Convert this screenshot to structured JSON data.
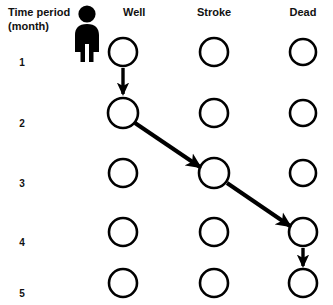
{
  "figure": {
    "title_line1": "Time period",
    "title_line2": "(month)",
    "person_icon": "person-pictogram"
  },
  "columns": [
    {
      "id": "well",
      "label": "Well",
      "x": 123
    },
    {
      "id": "stroke",
      "label": "Stroke",
      "x": 214
    },
    {
      "id": "dead",
      "label": "Dead",
      "x": 303
    }
  ],
  "rows": [
    {
      "label": "1",
      "y": 52,
      "label_y": 66
    },
    {
      "label": "2",
      "y": 113,
      "label_y": 127
    },
    {
      "label": "3",
      "y": 173,
      "label_y": 187
    },
    {
      "label": "4",
      "y": 232,
      "label_y": 246
    },
    {
      "label": "5",
      "y": 283,
      "label_y": 297
    }
  ],
  "nodes": [
    {
      "row": 1,
      "column": "well",
      "state": "Well",
      "cx": 123,
      "cy": 52,
      "r": 14
    },
    {
      "row": 1,
      "column": "stroke",
      "state": "Stroke",
      "cx": 214,
      "cy": 52,
      "r": 14
    },
    {
      "row": 1,
      "column": "dead",
      "state": "Dead",
      "cx": 303,
      "cy": 52,
      "r": 13
    },
    {
      "row": 2,
      "column": "well",
      "state": "Well",
      "cx": 123,
      "cy": 113,
      "r": 15
    },
    {
      "row": 2,
      "column": "stroke",
      "state": "Stroke",
      "cx": 214,
      "cy": 113,
      "r": 14
    },
    {
      "row": 2,
      "column": "dead",
      "state": "Dead",
      "cx": 303,
      "cy": 113,
      "r": 13
    },
    {
      "row": 3,
      "column": "well",
      "state": "Well",
      "cx": 123,
      "cy": 173,
      "r": 14
    },
    {
      "row": 3,
      "column": "stroke",
      "state": "Stroke",
      "cx": 214,
      "cy": 173,
      "r": 15
    },
    {
      "row": 3,
      "column": "dead",
      "state": "Dead",
      "cx": 303,
      "cy": 173,
      "r": 13
    },
    {
      "row": 4,
      "column": "well",
      "state": "Well",
      "cx": 123,
      "cy": 232,
      "r": 14
    },
    {
      "row": 4,
      "column": "stroke",
      "state": "Stroke",
      "cx": 214,
      "cy": 232,
      "r": 14
    },
    {
      "row": 4,
      "column": "dead",
      "state": "Dead",
      "cx": 303,
      "cy": 232,
      "r": 14
    },
    {
      "row": 5,
      "column": "well",
      "state": "Well",
      "cx": 123,
      "cy": 283,
      "r": 14
    },
    {
      "row": 5,
      "column": "stroke",
      "state": "Stroke",
      "cx": 214,
      "cy": 283,
      "r": 14
    },
    {
      "row": 5,
      "column": "dead",
      "state": "Dead",
      "cx": 303,
      "cy": 283,
      "r": 14
    }
  ],
  "transitions": [
    {
      "id": "t1",
      "from_state": "Well",
      "from_row": 1,
      "to_state": "Well",
      "to_row": 2,
      "kind": "vertical"
    },
    {
      "id": "t2",
      "from_state": "Well",
      "from_row": 2,
      "to_state": "Stroke",
      "to_row": 3,
      "kind": "diagonal"
    },
    {
      "id": "t3",
      "from_state": "Stroke",
      "from_row": 3,
      "to_state": "Dead",
      "to_row": 4,
      "kind": "diagonal"
    },
    {
      "id": "t4",
      "from_state": "Dead",
      "from_row": 4,
      "to_state": "Dead",
      "to_row": 5,
      "kind": "vertical"
    }
  ],
  "colors": {
    "background": "#ffffff",
    "stroke": "#000000",
    "text": "#111111",
    "node_fill": "#ffffff"
  }
}
